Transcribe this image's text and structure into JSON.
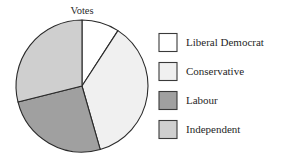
{
  "chart_data": {
    "type": "pie",
    "title": "Votes",
    "categories": [
      "Liberal Democrat",
      "Conservative",
      "Labour",
      "Independent"
    ],
    "values": [
      9,
      36,
      26,
      29
    ],
    "units": "percent",
    "start_angle_deg": 0,
    "direction": "clockwise",
    "colors": [
      "#ffffff",
      "#f0f0f0",
      "#a0a0a0",
      "#cfcfcf"
    ],
    "slice_edge_color": "#2a2a2a",
    "legend_position": "right",
    "grid": false,
    "xlabel": "",
    "ylabel": "",
    "slices": [
      {
        "label": "Liberal Democrat",
        "value": 9,
        "color": "#ffffff",
        "start_deg": 0,
        "end_deg": 33
      },
      {
        "label": "Conservative",
        "value": 36,
        "color": "#f0f0f0",
        "start_deg": 33,
        "end_deg": 164
      },
      {
        "label": "Labour",
        "value": 26,
        "color": "#a0a0a0",
        "start_deg": 164,
        "end_deg": 256
      },
      {
        "label": "Independent",
        "value": 29,
        "color": "#cfcfcf",
        "start_deg": 256,
        "end_deg": 360
      }
    ]
  },
  "legend": {
    "items": [
      {
        "label": "Liberal Democrat",
        "color": "#ffffff"
      },
      {
        "label": "Conservative",
        "color": "#f0f0f0"
      },
      {
        "label": "Labour",
        "color": "#a0a0a0"
      },
      {
        "label": "Independent",
        "color": "#cfcfcf"
      }
    ]
  }
}
